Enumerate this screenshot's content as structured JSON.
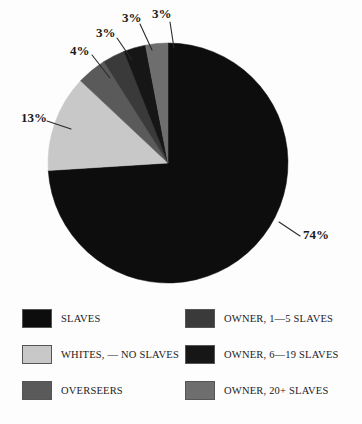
{
  "chart_data": {
    "type": "pie",
    "title": "",
    "subtitle": "",
    "xlabel": "",
    "ylabel": "",
    "legend_position": "bottom",
    "grid": false,
    "units": "percent",
    "categories": [
      "SLAVES",
      "WHITES, — NO SLAVES",
      "OVERSEERS",
      "OWNER, 1—5 SLAVES",
      "OWNER, 6—19 SLAVES",
      "OWNER, 20+ SLAVES"
    ],
    "values": [
      74,
      13,
      4,
      3,
      3,
      3
    ],
    "colors": [
      "#0d0d0d",
      "#c8c8c8",
      "#5a5a5a",
      "#3a3a3a",
      "#161616",
      "#6e6e6e"
    ],
    "slices": [
      {
        "label": "SLAVES",
        "value": 74,
        "display": "74%",
        "color": "#0d0d0d"
      },
      {
        "label": "WHITES, — NO SLAVES",
        "value": 13,
        "display": "13%",
        "color": "#c8c8c8"
      },
      {
        "label": "OVERSEERS",
        "value": 4,
        "display": "4%",
        "color": "#5a5a5a"
      },
      {
        "label": "OWNER, 1—5 SLAVES",
        "value": 3,
        "display": "3%",
        "color": "#3a3a3a"
      },
      {
        "label": "OWNER, 6—19 SLAVES",
        "value": 3,
        "display": "3%",
        "color": "#161616"
      },
      {
        "label": "OWNER, 20+ SLAVES",
        "value": 3,
        "display": "3%",
        "color": "#6e6e6e"
      }
    ]
  },
  "labels": {
    "slaves_pct": "74%",
    "whites_pct": "13%",
    "overseers_pct": "4%",
    "owner_1_5_pct": "3%",
    "owner_6_19_pct": "3%",
    "owner_20plus_pct": "3%"
  },
  "legend": {
    "left_column": [
      {
        "label": "SLAVES",
        "color": "#0d0d0d"
      },
      {
        "label": "WHITES, — NO SLAVES",
        "color": "#c8c8c8"
      },
      {
        "label": "OVERSEERS",
        "color": "#5a5a5a"
      }
    ],
    "right_column": [
      {
        "label": "OWNER, 1—5 SLAVES",
        "color": "#3a3a3a"
      },
      {
        "label": "OWNER, 6—19 SLAVES",
        "color": "#161616"
      },
      {
        "label": "OWNER, 20+ SLAVES",
        "color": "#6e6e6e"
      }
    ]
  },
  "colors": {
    "background": "#fdfdfd",
    "text": "#1a1a1a",
    "leader_line": "#2a2a2a"
  }
}
